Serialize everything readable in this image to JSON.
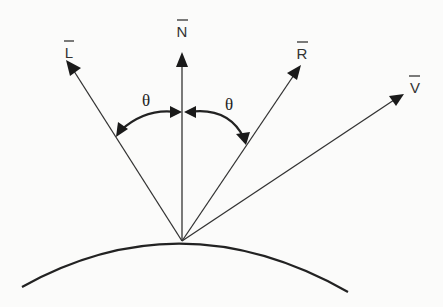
{
  "diagram": {
    "vectors": [
      {
        "id": "L",
        "label": "L",
        "description": "light direction"
      },
      {
        "id": "N",
        "label": "N",
        "description": "surface normal"
      },
      {
        "id": "R",
        "label": "R",
        "description": "reflection direction"
      },
      {
        "id": "V",
        "label": "V",
        "description": "view direction"
      }
    ],
    "angles": [
      {
        "label": "θ",
        "between": [
          "L",
          "N"
        ]
      },
      {
        "label": "θ",
        "between": [
          "N",
          "R"
        ]
      }
    ],
    "surface": {
      "label": "",
      "shape": "convex arc"
    },
    "colors": {
      "ink": "#222222",
      "background": "#fbfbfa"
    }
  }
}
